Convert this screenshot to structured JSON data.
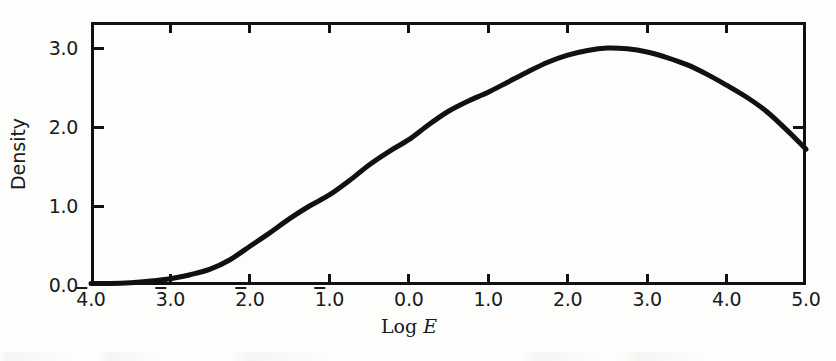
{
  "figure": {
    "background_color": "#fdfdfc",
    "ink_color": "#111111"
  },
  "chart_data": {
    "type": "line",
    "title": "",
    "subtitle": "",
    "xlabel_prefix": "Log",
    "xlabel_symbol": "E",
    "xlabel": "Log E",
    "ylabel": "Density",
    "xlim": [
      -4.0,
      5.0
    ],
    "ylim": [
      0.0,
      3.33
    ],
    "grid": false,
    "legend": null,
    "x_ticks": [
      -4.0,
      -3.0,
      -2.0,
      -1.0,
      0.0,
      1.0,
      2.0,
      3.0,
      4.0,
      5.0
    ],
    "x_tick_labels": [
      "4.0",
      "3.0",
      "2.0",
      "1.0",
      "0.0",
      "1.0",
      "2.0",
      "3.0",
      "4.0",
      "5.0"
    ],
    "x_tick_negative": [
      true,
      true,
      true,
      true,
      false,
      false,
      false,
      false,
      false,
      false
    ],
    "y_ticks": [
      0.0,
      1.0,
      2.0,
      3.0
    ],
    "y_tick_labels": [
      "0.0",
      "1.0",
      "2.0",
      "3.0"
    ],
    "series": [
      {
        "name": "characteristic-curve",
        "x": [
          -4.0,
          -3.75,
          -3.5,
          -3.25,
          -3.0,
          -2.75,
          -2.5,
          -2.25,
          -2.0,
          -1.75,
          -1.5,
          -1.25,
          -1.0,
          -0.75,
          -0.5,
          -0.25,
          0.0,
          0.25,
          0.5,
          0.75,
          1.0,
          1.25,
          1.5,
          1.75,
          2.0,
          2.25,
          2.5,
          2.75,
          3.0,
          3.25,
          3.5,
          3.75,
          4.0,
          4.25,
          4.5,
          4.75,
          5.0
        ],
        "values": [
          0.02,
          0.02,
          0.03,
          0.05,
          0.08,
          0.13,
          0.2,
          0.32,
          0.49,
          0.66,
          0.84,
          1.0,
          1.14,
          1.32,
          1.52,
          1.69,
          1.84,
          2.03,
          2.2,
          2.33,
          2.44,
          2.57,
          2.7,
          2.82,
          2.91,
          2.97,
          3.0,
          2.99,
          2.95,
          2.88,
          2.79,
          2.67,
          2.53,
          2.38,
          2.2,
          1.97,
          1.72
        ]
      }
    ],
    "annotations": {
      "peak_x": 2.5,
      "peak_y": 3.0,
      "toe_y": 0.02,
      "end_y": 1.72
    }
  }
}
